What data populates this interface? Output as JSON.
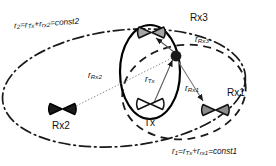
{
  "figure": {
    "type": "bistatic-multistatic-radar-geometry-diagram",
    "background_color": "#ffffff",
    "stroke_color": "#1a1a1a"
  },
  "nodes": {
    "tx": {
      "label": "Tx",
      "kind": "bowtie-antenna",
      "fill": "#ffffff",
      "x": 150,
      "y": 112
    },
    "rx1": {
      "label": "Rx1",
      "kind": "bowtie-antenna",
      "fill": "#8c8c8c",
      "x": 215,
      "y": 110
    },
    "rx2": {
      "label": "Rx2",
      "kind": "bowtie-antenna",
      "fill": "#1a1a1a",
      "x": 62,
      "y": 110
    },
    "rx3": {
      "label": "Rx3",
      "kind": "bowtie-antenna",
      "fill": "#9a9a9a",
      "x": 152,
      "y": 33
    },
    "scatterer": {
      "label": "",
      "kind": "scatterer-point",
      "fill": "#1a1a1a",
      "x": 176,
      "y": 56
    }
  },
  "range_labels": {
    "r_tx": {
      "base": "r",
      "sub": "Tx",
      "x": 140,
      "y": 76
    },
    "r_rx1": {
      "base": "r",
      "sub": "Rx1",
      "x": 186,
      "y": 85
    },
    "r_rx2": {
      "base": "r",
      "sub": "Rx2",
      "x": 94,
      "y": 70
    },
    "r_rx3": {
      "base": "r",
      "sub": "Rx3",
      "x": 196,
      "y": 39
    }
  },
  "ellipse_labels": {
    "const1": {
      "text_parts": [
        "r",
        "1",
        "=r",
        "Tx",
        "+r",
        "rx1",
        "=const1"
      ],
      "plain": "r1=rTx+rrx1=const1",
      "x": 176,
      "y": 150,
      "style": "dashed",
      "foci": [
        "Tx",
        "Rx1"
      ]
    },
    "const2": {
      "text_parts": [
        "r",
        "2",
        "=r",
        "Tx",
        "+r",
        "rx2",
        "=const2"
      ],
      "plain": "r2=rTx+rrx2=const2",
      "x": 14,
      "y": 24,
      "style": "dash-dot",
      "foci": [
        "Tx",
        "Rx2"
      ]
    }
  },
  "ellipses": [
    {
      "name": "rx3-ellipse",
      "style": "solid",
      "cx": 150,
      "cy": 72,
      "rx": 30,
      "ry": 47,
      "rotation": 0
    },
    {
      "name": "rx1-ellipse",
      "style": "dashed",
      "cx": 184,
      "cy": 92,
      "rx": 62,
      "ry": 47,
      "rotation": -8
    },
    {
      "name": "rx2-ellipse",
      "style": "dash-dot",
      "cx": 124,
      "cy": 88,
      "rx": 122,
      "ry": 58,
      "rotation": -6
    }
  ]
}
